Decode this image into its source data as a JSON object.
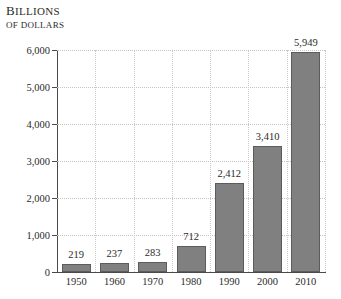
{
  "chart_data": {
    "type": "bar",
    "title": "BILLIONS OF DOLLARS",
    "title_line1": "Billions",
    "title_line2": "of dollars",
    "xlabel": "",
    "ylabel": "Billions of dollars",
    "categories": [
      "1950",
      "1960",
      "1970",
      "1980",
      "1990",
      "2000",
      "2010"
    ],
    "values": [
      219,
      237,
      283,
      712,
      2412,
      3410,
      5949
    ],
    "value_labels": [
      "219",
      "237",
      "283",
      "712",
      "2,412",
      "3,410",
      "5,949"
    ],
    "ylim": [
      0,
      6000
    ],
    "yticks": [
      0,
      1000,
      2000,
      3000,
      4000,
      5000,
      6000
    ],
    "ytick_labels": [
      "0",
      "1,000",
      "2,000",
      "3,000",
      "4,000",
      "5,000",
      "6,000"
    ],
    "grid": "both-dotted",
    "legend": "none",
    "bar_color": "#808080",
    "bar_border_color": "#5c5c5c",
    "grid_color": "#c4c4c4",
    "axis_color": "#4a4a4a",
    "text_color": "#2b2b2b"
  }
}
